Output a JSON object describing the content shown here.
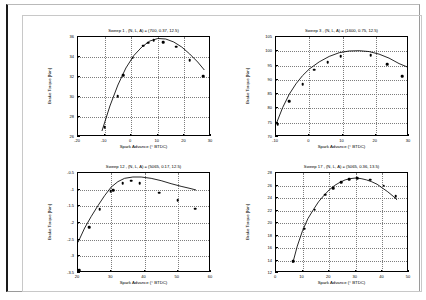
{
  "page": {
    "background_color": "#ffffff",
    "frame_color": "#1a1a1a"
  },
  "common": {
    "xlabel": "Spark Advance (° BTDC)",
    "ylabel": "Brake Torque [Nm]"
  },
  "chart_data": [
    {
      "type": "scatter",
      "id": "sweep-1",
      "title": "Sweep 1 , (N, L, A) = (700, 0.37, 12.5)",
      "xlabel": "Spark Advance (° BTDC)",
      "ylabel": "Brake Torque [Nm]",
      "xlim": [
        -20,
        30
      ],
      "ylim": [
        26,
        36
      ],
      "xticks": [
        -20,
        -10,
        0,
        10,
        20,
        30
      ],
      "yticks": [
        26,
        28,
        30,
        32,
        34,
        36
      ],
      "grid": true,
      "points": [
        {
          "x": -10.0,
          "y": 27.0
        },
        {
          "x": -5.0,
          "y": 30.1
        },
        {
          "x": -3.0,
          "y": 32.2
        },
        {
          "x": 0.5,
          "y": 33.95
        },
        {
          "x": 4.5,
          "y": 35.15
        },
        {
          "x": 6.5,
          "y": 35.45
        },
        {
          "x": 8.5,
          "y": 35.7
        },
        {
          "x": 12.0,
          "y": 35.5
        },
        {
          "x": 17.0,
          "y": 35.05
        },
        {
          "x": 22.0,
          "y": 33.7
        },
        {
          "x": 27.0,
          "y": 32.1
        }
      ],
      "fit": [
        {
          "x": -11.0,
          "y": 26.6
        },
        {
          "x": -8.0,
          "y": 29.1
        },
        {
          "x": -5.0,
          "y": 31.2
        },
        {
          "x": -2.0,
          "y": 32.9
        },
        {
          "x": 1.0,
          "y": 34.15
        },
        {
          "x": 4.0,
          "y": 35.0
        },
        {
          "x": 7.0,
          "y": 35.6
        },
        {
          "x": 10.0,
          "y": 35.85
        },
        {
          "x": 13.0,
          "y": 35.8
        },
        {
          "x": 16.0,
          "y": 35.5
        },
        {
          "x": 19.0,
          "y": 35.0
        },
        {
          "x": 22.0,
          "y": 34.3
        },
        {
          "x": 25.0,
          "y": 33.5
        },
        {
          "x": 27.5,
          "y": 32.7
        }
      ]
    },
    {
      "type": "scatter",
      "id": "sweep-3",
      "title": "Sweep 3 , (N, L, A) = (1600, 0.75, 12.5)",
      "xlabel": "Spark Advance (° BTDC)",
      "ylabel": "Brake Torque [Nm]",
      "xlim": [
        -10,
        30
      ],
      "ylim": [
        70,
        105
      ],
      "xticks": [
        -10,
        0,
        10,
        20,
        30
      ],
      "yticks": [
        70,
        75,
        80,
        85,
        90,
        95,
        100,
        105
      ],
      "grid": true,
      "points": [
        {
          "x": -9.5,
          "y": 74.5
        },
        {
          "x": -6.0,
          "y": 82.6
        },
        {
          "x": -2.0,
          "y": 88.4
        },
        {
          "x": 1.5,
          "y": 93.6
        },
        {
          "x": 5.5,
          "y": 96.2
        },
        {
          "x": 9.5,
          "y": 98.3
        },
        {
          "x": 18.5,
          "y": 98.7
        },
        {
          "x": 23.5,
          "y": 95.4
        },
        {
          "x": 28.0,
          "y": 91.2
        }
      ],
      "fit": [
        {
          "x": -10.0,
          "y": 74.4
        },
        {
          "x": -8.0,
          "y": 80.3
        },
        {
          "x": -6.0,
          "y": 85.0
        },
        {
          "x": -4.0,
          "y": 88.6
        },
        {
          "x": -2.0,
          "y": 91.5
        },
        {
          "x": 0.0,
          "y": 93.8
        },
        {
          "x": 3.0,
          "y": 96.3
        },
        {
          "x": 6.0,
          "y": 98.2
        },
        {
          "x": 9.0,
          "y": 99.5
        },
        {
          "x": 12.0,
          "y": 100.1
        },
        {
          "x": 15.0,
          "y": 100.2
        },
        {
          "x": 18.0,
          "y": 99.9
        },
        {
          "x": 21.0,
          "y": 99.0
        },
        {
          "x": 24.0,
          "y": 97.6
        },
        {
          "x": 27.0,
          "y": 95.7
        },
        {
          "x": 29.5,
          "y": 94.5
        }
      ]
    },
    {
      "type": "scatter",
      "id": "sweep-12",
      "title": "Sweep 12 , (N, L, A) = (5065, 0.17, 12.5)",
      "xlabel": "Spark Advance (° BTDC)",
      "ylabel": "Brake Torque [Nm]",
      "xlim": [
        20,
        60
      ],
      "ylim": [
        -3.5,
        -0.5
      ],
      "xticks": [
        20,
        30,
        40,
        50,
        60
      ],
      "yticks": [
        -3.5,
        -3,
        -2.5,
        -2,
        -1.5,
        -1,
        -0.5
      ],
      "ytick_labels": [
        "-3.5",
        "-3",
        "-2.5",
        "-2",
        "-1.5",
        "-1",
        "-0.5"
      ],
      "grid": true,
      "points": [
        {
          "x": 20.3,
          "y": -3.42
        },
        {
          "x": 23.3,
          "y": -2.12
        },
        {
          "x": 26.5,
          "y": -1.58
        },
        {
          "x": 29.8,
          "y": -1.04
        },
        {
          "x": 30.6,
          "y": -1.02
        },
        {
          "x": 33.5,
          "y": -0.8
        },
        {
          "x": 36.0,
          "y": -0.73
        },
        {
          "x": 38.6,
          "y": -0.8
        },
        {
          "x": 44.5,
          "y": -1.09
        },
        {
          "x": 50.0,
          "y": -1.32
        },
        {
          "x": 55.3,
          "y": -1.57
        }
      ],
      "fit": [
        {
          "x": 20.0,
          "y": -2.58
        },
        {
          "x": 22.0,
          "y": -2.15
        },
        {
          "x": 24.0,
          "y": -1.8
        },
        {
          "x": 26.0,
          "y": -1.48
        },
        {
          "x": 28.0,
          "y": -1.18
        },
        {
          "x": 30.0,
          "y": -0.92
        },
        {
          "x": 32.0,
          "y": -0.76
        },
        {
          "x": 34.0,
          "y": -0.66
        },
        {
          "x": 36.5,
          "y": -0.62
        },
        {
          "x": 39.0,
          "y": -0.62
        },
        {
          "x": 42.0,
          "y": -0.66
        },
        {
          "x": 45.0,
          "y": -0.73
        },
        {
          "x": 48.0,
          "y": -0.82
        },
        {
          "x": 51.0,
          "y": -0.9
        },
        {
          "x": 54.0,
          "y": -0.97
        },
        {
          "x": 55.5,
          "y": -1.01
        }
      ]
    },
    {
      "type": "scatter",
      "id": "sweep-17",
      "title": "Sweep 17 , (N, L, A) = (5065, 0.36, 13.5)",
      "xlabel": "Spark Advance (° BTDC)",
      "ylabel": "Brake Torque [Nm]",
      "xlim": [
        0,
        50
      ],
      "ylim": [
        12,
        28
      ],
      "xticks": [
        0,
        10,
        20,
        30,
        40,
        50
      ],
      "yticks": [
        12,
        14,
        16,
        18,
        20,
        22,
        24,
        26,
        28
      ],
      "grid": true,
      "points": [
        {
          "x": 6.5,
          "y": 13.9
        },
        {
          "x": 10.5,
          "y": 19.1
        },
        {
          "x": 14.5,
          "y": 22.1
        },
        {
          "x": 18.5,
          "y": 24.5
        },
        {
          "x": 21.5,
          "y": 25.6
        },
        {
          "x": 24.5,
          "y": 26.5
        },
        {
          "x": 27.5,
          "y": 27.0
        },
        {
          "x": 30.5,
          "y": 27.2
        },
        {
          "x": 35.5,
          "y": 26.9
        },
        {
          "x": 40.5,
          "y": 26.0
        },
        {
          "x": 45.0,
          "y": 24.3
        }
      ],
      "fit": [
        {
          "x": 6.3,
          "y": 13.6
        },
        {
          "x": 8.0,
          "y": 16.3
        },
        {
          "x": 10.0,
          "y": 18.8
        },
        {
          "x": 12.0,
          "y": 20.7
        },
        {
          "x": 14.0,
          "y": 22.1
        },
        {
          "x": 16.0,
          "y": 23.4
        },
        {
          "x": 18.0,
          "y": 24.4
        },
        {
          "x": 20.0,
          "y": 25.3
        },
        {
          "x": 22.0,
          "y": 26.0
        },
        {
          "x": 24.0,
          "y": 26.5
        },
        {
          "x": 26.0,
          "y": 26.9
        },
        {
          "x": 28.0,
          "y": 27.1
        },
        {
          "x": 30.0,
          "y": 27.2
        },
        {
          "x": 32.0,
          "y": 27.1
        },
        {
          "x": 34.0,
          "y": 26.9
        },
        {
          "x": 36.0,
          "y": 26.6
        },
        {
          "x": 38.0,
          "y": 26.2
        },
        {
          "x": 40.0,
          "y": 25.6
        },
        {
          "x": 42.0,
          "y": 25.0
        },
        {
          "x": 44.0,
          "y": 24.3
        },
        {
          "x": 45.5,
          "y": 23.7
        }
      ]
    }
  ]
}
